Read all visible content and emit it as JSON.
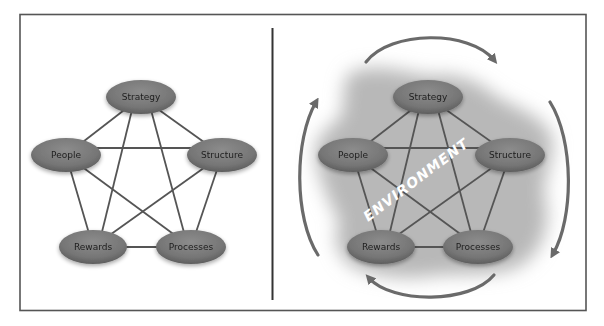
{
  "figure": {
    "left_panel": {
      "nodes": [
        {
          "id": "strategy",
          "label": "Strategy",
          "cx": 141,
          "cy": 97
        },
        {
          "id": "people",
          "label": "People",
          "cx": 66,
          "cy": 155
        },
        {
          "id": "structure",
          "label": "Structure",
          "cx": 222,
          "cy": 155
        },
        {
          "id": "rewards",
          "label": "Rewards",
          "cx": 93,
          "cy": 247
        },
        {
          "id": "processes",
          "label": "Processes",
          "cx": 191,
          "cy": 247
        }
      ]
    },
    "right_panel": {
      "environment_label": "ENVIRONMENT",
      "nodes": [
        {
          "id": "strategy",
          "label": "Strategy",
          "cx": 428,
          "cy": 97
        },
        {
          "id": "people",
          "label": "People",
          "cx": 353,
          "cy": 155
        },
        {
          "id": "structure",
          "label": "Structure",
          "cx": 510,
          "cy": 155
        },
        {
          "id": "rewards",
          "label": "Rewards",
          "cx": 381,
          "cy": 247
        },
        {
          "id": "processes",
          "label": "Processes",
          "cx": 478,
          "cy": 247
        }
      ],
      "cycle_arrows": [
        "top-arrow-clockwise",
        "right-arrow-clockwise",
        "bottom-arrow-clockwise",
        "left-arrow-clockwise"
      ]
    },
    "edges": "complete graph — every node connected to every other node",
    "colors": {
      "border": "#555555",
      "divider": "#333333",
      "node_fill": "#7a7a7a",
      "node_text": "#1e1e1e",
      "edge": "#555555",
      "environment_fill": "#b8b8b8",
      "arrow": "#6a6a6a",
      "environment_text": "#ffffff"
    }
  }
}
